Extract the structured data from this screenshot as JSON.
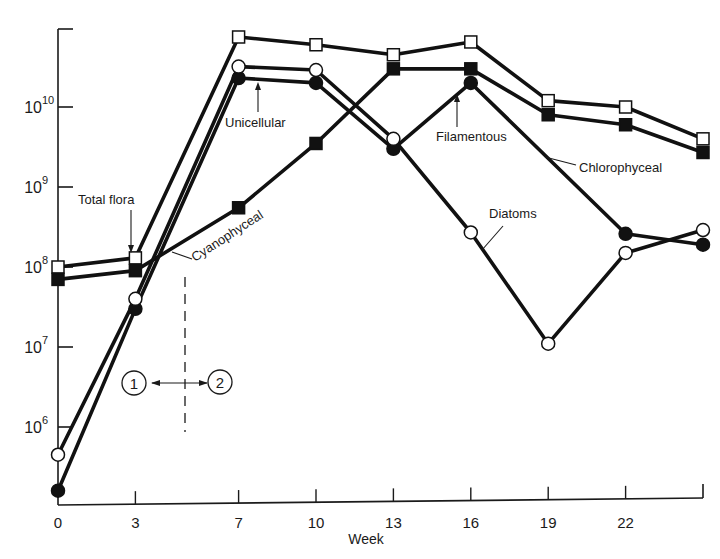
{
  "chart_data": {
    "type": "line",
    "title": "",
    "xlabel": "Week",
    "ylabel": "",
    "yscale": "log",
    "ylim": [
      100000.0,
      100000000000.0
    ],
    "xlim": [
      0,
      25
    ],
    "x": [
      0,
      3,
      7,
      10,
      13,
      16,
      19,
      22,
      25
    ],
    "xticks": [
      "0",
      "3",
      "7",
      "10",
      "13",
      "16",
      "19",
      "22",
      ""
    ],
    "yticks": [
      {
        "value": 1000000.0,
        "base": "10",
        "exp": "6"
      },
      {
        "value": 10000000.0,
        "base": "10",
        "exp": "7"
      },
      {
        "value": 100000000.0,
        "base": "10",
        "exp": "8"
      },
      {
        "value": 1000000000.0,
        "base": "10",
        "exp": "9"
      },
      {
        "value": 10000000000.0,
        "base": "10",
        "exp": "10"
      }
    ],
    "grid": false,
    "series": [
      {
        "name": "Total flora",
        "marker": "open-square",
        "values": [
          100000000.0,
          130000000.0,
          75000000000.0,
          60000000000.0,
          45000000000.0,
          65000000000.0,
          12000000000.0,
          10000000000.0,
          4000000000.0
        ]
      },
      {
        "name": "Cyanophyceal",
        "marker": "filled-square",
        "values": [
          70000000.0,
          90000000.0,
          550000000.0,
          3500000000.0,
          30000000000.0,
          30000000000.0,
          8000000000.0,
          6000000000.0,
          2700000000.0
        ]
      },
      {
        "name": "Chlorophyceal",
        "marker": "filled-circle",
        "values": [
          160000.0,
          30000000.0,
          23000000000.0,
          20000000000.0,
          3000000000.0,
          20000000000.0,
          null,
          260000000.0,
          190000000.0
        ]
      },
      {
        "name": "Diatoms",
        "marker": "open-circle",
        "values": [
          450000.0,
          40000000.0,
          32000000000.0,
          29000000000.0,
          4000000000.0,
          270000000.0,
          11000000.0,
          150000000.0,
          290000000.0
        ]
      }
    ],
    "annotations": [
      {
        "text": "Total flora",
        "type": "label"
      },
      {
        "text": "Unicellular",
        "type": "label"
      },
      {
        "text": "Filamentous",
        "type": "label"
      },
      {
        "text": "Chlorophyceal",
        "type": "label"
      },
      {
        "text": "Cyanophyceal",
        "type": "label"
      },
      {
        "text": "Diatoms",
        "type": "label"
      },
      {
        "text": "1",
        "type": "phase-marker"
      },
      {
        "text": "2",
        "type": "phase-marker"
      }
    ]
  },
  "labels": {
    "total_flora": "Total flora",
    "unicellular": "Unicellular",
    "filamentous": "Filamentous",
    "chlorophyceal": "Chlorophyceal",
    "cyanophyceal": "Cyanophyceal",
    "diatoms": "Diatoms",
    "phase1": "1",
    "phase2": "2",
    "xlabel": "Week"
  }
}
